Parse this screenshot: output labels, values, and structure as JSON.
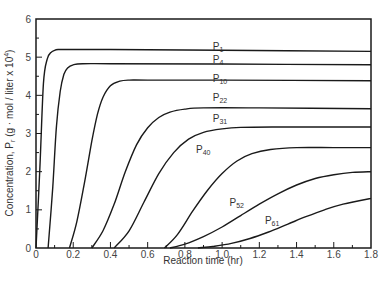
{
  "chart_data": {
    "type": "line",
    "title": "",
    "xlabel": "Reaction time (hr)",
    "ylabel": "Concentration, P_r (g · mol / liter x 10^4)",
    "ylabel_parts": {
      "main": "Concentration, P",
      "sub": "r",
      "rest": "  (g · mol / liter x 10",
      "sup": "4",
      "close": ")"
    },
    "xlim": [
      0,
      1.8
    ],
    "ylim": [
      0,
      6
    ],
    "x_ticks": [
      0,
      0.2,
      0.4,
      0.6,
      0.8,
      1.0,
      1.2,
      1.4,
      1.6,
      1.8
    ],
    "x_tick_labels": [
      "0",
      "0.2",
      "0.4",
      "0.6",
      "0.8",
      "1.0",
      "1.2",
      "1.4",
      "1.6",
      "1.8"
    ],
    "x_minor_ticks": [
      0.1,
      0.3,
      0.5,
      0.7,
      0.9,
      1.1,
      1.3,
      1.5,
      1.7
    ],
    "y_ticks": [
      0,
      1,
      2,
      3,
      4,
      5,
      6
    ],
    "y_tick_labels": [
      "0",
      "1",
      "2",
      "3",
      "4",
      "5",
      "6"
    ],
    "y_minor_ticks": [
      0.5,
      1.5,
      2.5,
      3.5,
      4.5,
      5.5
    ],
    "grid": false,
    "legend": "inline-labels",
    "series": [
      {
        "name": "P1",
        "label_main": "P",
        "label_sub": "1",
        "label_at": [
          0.95,
          5.2
        ],
        "x": [
          0,
          0.02,
          0.04,
          0.06,
          0.08,
          0.1,
          0.12,
          0.15,
          0.4,
          1.0,
          1.8
        ],
        "y": [
          0,
          2.0,
          4.3,
          4.95,
          5.12,
          5.18,
          5.2,
          5.2,
          5.2,
          5.18,
          5.15
        ]
      },
      {
        "name": "P4",
        "label_main": "P",
        "label_sub": "4",
        "label_at": [
          0.95,
          4.85
        ],
        "x": [
          0.065,
          0.09,
          0.11,
          0.13,
          0.15,
          0.17,
          0.2,
          0.25,
          0.4,
          1.0,
          1.8
        ],
        "y": [
          0,
          1.6,
          3.2,
          4.1,
          4.55,
          4.72,
          4.8,
          4.83,
          4.83,
          4.82,
          4.8
        ]
      },
      {
        "name": "P10",
        "label_main": "P",
        "label_sub": "10",
        "label_at": [
          0.95,
          4.35
        ],
        "x": [
          0.18,
          0.22,
          0.26,
          0.3,
          0.33,
          0.36,
          0.4,
          0.45,
          0.5,
          0.6,
          1.0,
          1.8
        ],
        "y": [
          0,
          0.7,
          1.7,
          2.8,
          3.5,
          3.95,
          4.25,
          4.37,
          4.4,
          4.4,
          4.4,
          4.38
        ]
      },
      {
        "name": "P22",
        "label_main": "P",
        "label_sub": "22",
        "label_at": [
          0.95,
          3.85
        ],
        "x": [
          0.3,
          0.36,
          0.42,
          0.48,
          0.54,
          0.6,
          0.66,
          0.72,
          0.8,
          0.9,
          1.2,
          1.8
        ],
        "y": [
          0,
          0.45,
          1.15,
          2.0,
          2.7,
          3.15,
          3.42,
          3.56,
          3.64,
          3.67,
          3.67,
          3.65
        ]
      },
      {
        "name": "P31",
        "label_main": "P",
        "label_sub": "31",
        "label_at": [
          0.95,
          3.3
        ],
        "x": [
          0.42,
          0.5,
          0.58,
          0.66,
          0.74,
          0.82,
          0.9,
          1.0,
          1.1,
          1.3,
          1.8
        ],
        "y": [
          0,
          0.45,
          1.2,
          1.95,
          2.5,
          2.85,
          3.03,
          3.12,
          3.16,
          3.17,
          3.17
        ]
      },
      {
        "name": "P40",
        "label_main": "P",
        "label_sub": "40",
        "label_at": [
          0.86,
          2.5
        ],
        "x": [
          0.69,
          0.76,
          0.84,
          0.92,
          1.0,
          1.08,
          1.16,
          1.26,
          1.4,
          1.6,
          1.8
        ],
        "y": [
          0,
          0.35,
          0.95,
          1.5,
          1.95,
          2.28,
          2.47,
          2.58,
          2.63,
          2.63,
          2.63
        ]
      },
      {
        "name": "P52",
        "label_main": "P",
        "label_sub": "52",
        "label_at": [
          1.04,
          1.1
        ],
        "x": [
          0.72,
          0.8,
          0.9,
          1.0,
          1.1,
          1.2,
          1.3,
          1.4,
          1.5,
          1.6,
          1.7,
          1.8
        ],
        "y": [
          0,
          0.1,
          0.3,
          0.55,
          0.85,
          1.15,
          1.42,
          1.65,
          1.82,
          1.92,
          1.98,
          2.0
        ]
      },
      {
        "name": "P61",
        "label_main": "P",
        "label_sub": "61",
        "label_at": [
          1.23,
          0.62
        ],
        "x": [
          0.87,
          0.95,
          1.05,
          1.15,
          1.25,
          1.35,
          1.45,
          1.55,
          1.65,
          1.8
        ],
        "y": [
          0,
          0.04,
          0.12,
          0.25,
          0.42,
          0.62,
          0.82,
          1.0,
          1.15,
          1.3
        ]
      }
    ]
  }
}
